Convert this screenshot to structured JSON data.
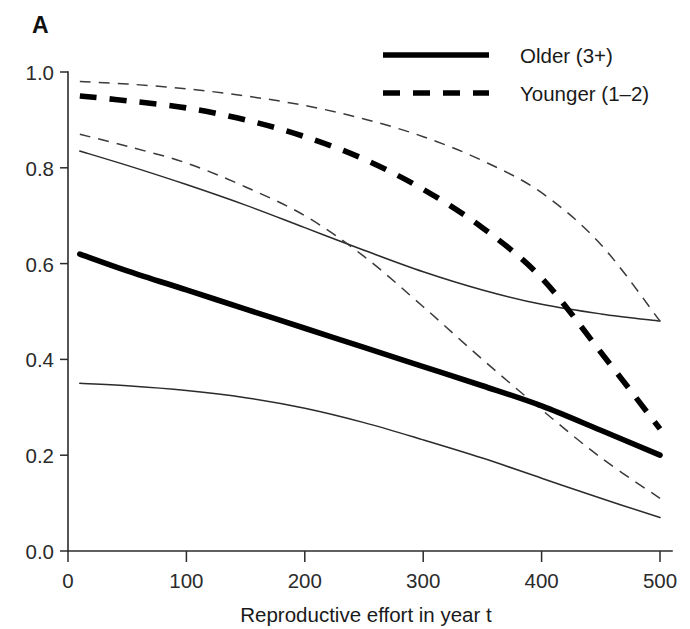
{
  "panel": {
    "label": "A"
  },
  "axes": {
    "x": {
      "title": "Reproductive effort in year t",
      "ticks": [
        0,
        100,
        200,
        300,
        400,
        500
      ],
      "tick_labels": [
        "0",
        "100",
        "200",
        "300",
        "400",
        "500"
      ],
      "range": [
        0,
        510
      ]
    },
    "y": {
      "title": "",
      "ticks": [
        0.0,
        0.2,
        0.4,
        0.6,
        0.8,
        1.0
      ],
      "tick_labels": [
        "0.0",
        "0.2",
        "0.4",
        "0.6",
        "0.8",
        "1.0"
      ],
      "range": [
        0.0,
        1.0
      ]
    }
  },
  "legend": {
    "position": "top-right",
    "entries": [
      {
        "label": "Older (3+)",
        "style": "solid"
      },
      {
        "label": "Younger (1–2)",
        "style": "dashed"
      }
    ]
  },
  "colors": {
    "line": "#000000",
    "ci": "#2b2b2b",
    "axis": "#2b2b2b",
    "background": "#ffffff"
  },
  "chart_data": {
    "type": "line",
    "title": "",
    "xlabel": "Reproductive effort in year t",
    "ylabel": "",
    "xlim": [
      0,
      510
    ],
    "ylim": [
      0.0,
      1.0
    ],
    "grid": false,
    "legend_position": "top-right",
    "x": [
      10,
      50,
      100,
      150,
      200,
      250,
      300,
      350,
      400,
      450,
      500
    ],
    "series": [
      {
        "name": "Older (3+)",
        "style": "solid",
        "width": "thick",
        "role": "fit",
        "values": [
          0.62,
          0.585,
          0.545,
          0.505,
          0.465,
          0.425,
          0.385,
          0.345,
          0.303,
          0.252,
          0.2
        ]
      },
      {
        "name": "Older (3+) upper CI",
        "style": "solid",
        "width": "thin",
        "role": "ci-upper",
        "values": [
          0.835,
          0.805,
          0.765,
          0.722,
          0.675,
          0.628,
          0.583,
          0.545,
          0.515,
          0.495,
          0.48
        ]
      },
      {
        "name": "Older (3+) lower CI",
        "style": "solid",
        "width": "thin",
        "role": "ci-lower",
        "values": [
          0.35,
          0.345,
          0.335,
          0.32,
          0.298,
          0.268,
          0.232,
          0.194,
          0.152,
          0.11,
          0.07
        ]
      },
      {
        "name": "Younger (1–2)",
        "style": "dashed",
        "width": "thick",
        "role": "fit",
        "values": [
          0.95,
          0.94,
          0.925,
          0.9,
          0.865,
          0.818,
          0.755,
          0.675,
          0.57,
          0.415,
          0.255
        ]
      },
      {
        "name": "Younger (1–2) upper CI",
        "style": "dashed",
        "width": "thin",
        "role": "ci-upper",
        "values": [
          0.98,
          0.975,
          0.965,
          0.95,
          0.93,
          0.902,
          0.865,
          0.815,
          0.748,
          0.64,
          0.48
        ]
      },
      {
        "name": "Younger (1–2) lower CI",
        "style": "dashed",
        "width": "thin",
        "role": "ci-lower",
        "values": [
          0.87,
          0.845,
          0.81,
          0.76,
          0.7,
          0.615,
          0.51,
          0.4,
          0.295,
          0.195,
          0.11
        ]
      }
    ],
    "annotations": [
      {
        "text": "Younger lower CI crosses Older upper CI near x=230, y=0.61"
      },
      {
        "text": "Younger fit crosses Older upper CI near x=360, y=0.535"
      },
      {
        "text": "Younger lower CI crosses Older fit near x=375, y=0.295"
      }
    ]
  }
}
